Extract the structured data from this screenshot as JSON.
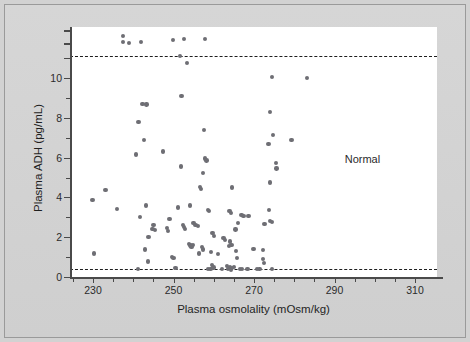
{
  "figure": {
    "background_color": "#d2d2d2",
    "plot_background_color": "#ffffff",
    "point_color": "#6e6e74",
    "axis_color": "#4a4a4a"
  },
  "annotations": {
    "normal_label": "Normal"
  },
  "chart_data": {
    "type": "scatter",
    "title": "",
    "xlabel": "Plasma osmolality (mOsm/kg)",
    "ylabel": "Plasma ADH (pg/mL)",
    "xlim": [
      222,
      315
    ],
    "ylim": [
      0,
      12.6
    ],
    "xticks": [
      230,
      250,
      270,
      290,
      310
    ],
    "xtick_labels": [
      "230",
      "250",
      "270",
      "290",
      "310"
    ],
    "xminorticks": [
      225,
      235,
      240,
      245,
      255,
      260,
      265,
      275,
      280,
      285,
      295,
      300,
      305,
      310
    ],
    "yticks": [
      0,
      2,
      4,
      6,
      8,
      10
    ],
    "ytick_labels": [
      "0",
      "2",
      "4",
      "6",
      "8",
      "10"
    ],
    "y_axis_break_above": 10.5,
    "grid": false,
    "legend": null,
    "reference_lines": [
      {
        "name": "upper-detection-limit",
        "y": 11.1,
        "style": "dashed"
      },
      {
        "name": "lower-detection-limit",
        "y": 0.4,
        "style": "dashed"
      }
    ],
    "annotations": [
      {
        "text": "Normal",
        "x": 298,
        "y": 5.9
      }
    ],
    "points": [
      [
        237.4,
        12.1
      ],
      [
        237.4,
        11.8
      ],
      [
        239.0,
        11.75
      ],
      [
        242.0,
        11.8
      ],
      [
        249.8,
        11.9
      ],
      [
        252.6,
        11.95
      ],
      [
        257.9,
        11.95
      ],
      [
        251.7,
        11.1
      ],
      [
        253.3,
        10.75
      ],
      [
        274.5,
        10.05
      ],
      [
        283.1,
        10.0
      ],
      [
        252.0,
        9.1
      ],
      [
        242.3,
        8.68
      ],
      [
        243.3,
        8.67
      ],
      [
        274.0,
        8.3
      ],
      [
        241.3,
        7.8
      ],
      [
        257.6,
        7.38
      ],
      [
        274.8,
        7.15
      ],
      [
        242.7,
        6.9
      ],
      [
        279.3,
        6.88
      ],
      [
        273.6,
        6.68
      ],
      [
        240.6,
        6.15
      ],
      [
        247.4,
        6.3
      ],
      [
        257.8,
        5.95
      ],
      [
        258.2,
        5.85
      ],
      [
        275.4,
        5.72
      ],
      [
        275.6,
        5.45
      ],
      [
        251.9,
        5.55
      ],
      [
        257.3,
        5.22
      ],
      [
        274.0,
        4.75
      ],
      [
        256.6,
        4.52
      ],
      [
        256.9,
        4.42
      ],
      [
        264.5,
        4.5
      ],
      [
        233.1,
        4.37
      ],
      [
        229.9,
        3.88
      ],
      [
        243.1,
        3.6
      ],
      [
        251.2,
        3.5
      ],
      [
        235.9,
        3.43
      ],
      [
        254.1,
        3.6
      ],
      [
        258.5,
        3.38
      ],
      [
        258.9,
        3.3
      ],
      [
        263.9,
        3.3
      ],
      [
        264.3,
        3.22
      ],
      [
        273.7,
        3.35
      ],
      [
        266.9,
        3.1
      ],
      [
        267.4,
        3.05
      ],
      [
        268.6,
        3.08
      ],
      [
        241.7,
        3.02
      ],
      [
        249.0,
        2.92
      ],
      [
        252.3,
        2.62
      ],
      [
        252.6,
        2.52
      ],
      [
        252.9,
        2.42
      ],
      [
        255.0,
        2.72
      ],
      [
        255.5,
        2.62
      ],
      [
        256.1,
        2.55
      ],
      [
        245.0,
        2.62
      ],
      [
        244.8,
        2.42
      ],
      [
        245.4,
        2.35
      ],
      [
        248.4,
        2.45
      ],
      [
        248.7,
        2.3
      ],
      [
        273.9,
        2.8
      ],
      [
        272.6,
        2.68
      ],
      [
        274.5,
        2.78
      ],
      [
        266.0,
        2.7
      ],
      [
        265.4,
        2.38
      ],
      [
        259.7,
        2.22
      ],
      [
        260.0,
        2.05
      ],
      [
        243.8,
        2.02
      ],
      [
        262.4,
        1.95
      ],
      [
        262.8,
        1.85
      ],
      [
        264.1,
        1.78
      ],
      [
        264.4,
        1.62
      ],
      [
        263.8,
        1.55
      ],
      [
        253.9,
        1.65
      ],
      [
        254.2,
        1.58
      ],
      [
        254.5,
        1.5
      ],
      [
        254.9,
        1.62
      ],
      [
        257.0,
        1.5
      ],
      [
        257.3,
        1.38
      ],
      [
        256.4,
        1.18
      ],
      [
        242.9,
        1.38
      ],
      [
        269.9,
        1.42
      ],
      [
        272.3,
        1.35
      ],
      [
        259.3,
        1.25
      ],
      [
        261.1,
        1.15
      ],
      [
        265.6,
        1.3
      ],
      [
        230.2,
        1.18
      ],
      [
        243.7,
        0.78
      ],
      [
        272.2,
        0.92
      ],
      [
        265.8,
        0.95
      ],
      [
        249.6,
        1.0
      ],
      [
        250.0,
        0.95
      ],
      [
        272.4,
        0.72
      ],
      [
        259.6,
        0.62
      ],
      [
        259.9,
        0.48
      ],
      [
        263.3,
        0.55
      ],
      [
        264.0,
        0.48
      ],
      [
        264.6,
        0.45
      ],
      [
        265.0,
        0.5
      ],
      [
        241.2,
        0.42
      ],
      [
        250.5,
        0.45
      ],
      [
        258.6,
        0.42
      ],
      [
        259.2,
        0.4
      ],
      [
        263.5,
        0.4
      ],
      [
        264.2,
        0.38
      ],
      [
        266.6,
        0.42
      ],
      [
        267.1,
        0.4
      ],
      [
        270.8,
        0.4
      ],
      [
        271.4,
        0.42
      ],
      [
        274.4,
        0.4
      ],
      [
        262.0,
        0.4
      ],
      [
        268.4,
        0.4
      ]
    ]
  }
}
